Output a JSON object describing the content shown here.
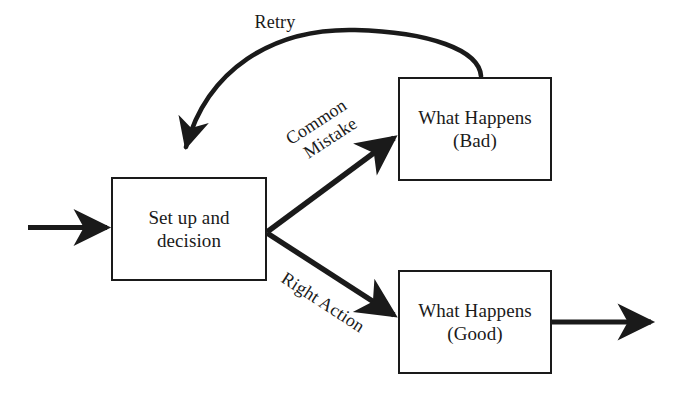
{
  "diagram": {
    "stroke_color": "#1a1a1a",
    "background_color": "#ffffff",
    "nodes": [
      {
        "id": "setup",
        "name": "setup-decision-node",
        "line1": "Set up and",
        "line2": "decision",
        "x": 111,
        "y": 177,
        "width": 156,
        "height": 104
      },
      {
        "id": "bad",
        "name": "what-happens-bad-node",
        "line1": "What Happens",
        "line2": "(Bad)",
        "x": 398,
        "y": 77,
        "width": 154,
        "height": 104
      },
      {
        "id": "good",
        "name": "what-happens-good-node",
        "line1": "What Happens",
        "line2": "(Good)",
        "x": 398,
        "y": 270,
        "width": 154,
        "height": 104
      }
    ],
    "edges": [
      {
        "id": "retry",
        "name": "retry-edge",
        "label": "Retry",
        "from": "bad",
        "to": "setup",
        "style": "curved"
      },
      {
        "id": "common-mistake",
        "name": "common-mistake-edge",
        "label_line1": "Common",
        "label_line2": "Mistake",
        "from": "setup",
        "to": "bad",
        "style": "straight"
      },
      {
        "id": "right-action",
        "name": "right-action-edge",
        "label": "Right Action",
        "from": "setup",
        "to": "good",
        "style": "straight"
      },
      {
        "id": "input",
        "name": "input-arrow-edge",
        "label": "",
        "from": "",
        "to": "setup",
        "style": "straight"
      },
      {
        "id": "output",
        "name": "output-arrow-edge",
        "label": "",
        "from": "good",
        "to": "",
        "style": "straight"
      }
    ]
  }
}
